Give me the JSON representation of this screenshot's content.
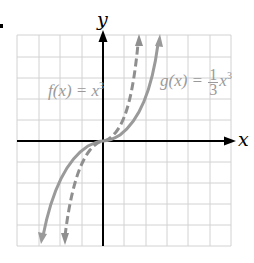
{
  "figure": {
    "x_axis_label": "x",
    "y_axis_label": "y",
    "grid": {
      "columns": 10,
      "rows": 10,
      "color": "#cfcfcf"
    },
    "curves": [
      {
        "name": "f",
        "label_prefix": "f(x) = x",
        "exponent": "3",
        "style": "dashed",
        "color": "#8f8f8f"
      },
      {
        "name": "g",
        "label_prefix": "g(x) = ",
        "coef_num": "1",
        "coef_den": "3",
        "label_var": "x",
        "exponent": "3",
        "style": "solid",
        "color": "#9a9a9a"
      }
    ]
  }
}
